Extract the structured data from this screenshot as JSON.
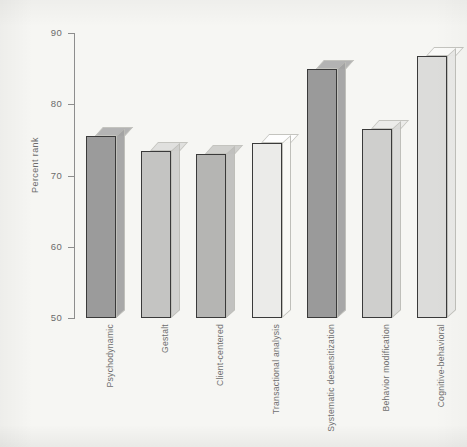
{
  "chart_data": {
    "type": "bar",
    "title": "",
    "xlabel": "",
    "ylabel": "Percent rank",
    "ylim": [
      50,
      90
    ],
    "yticks": [
      50,
      60,
      70,
      80,
      90
    ],
    "ytick_labels": [
      "50",
      "60",
      "70",
      "80",
      "90"
    ],
    "grid": false,
    "legend": null,
    "style": "3d-block-bars-grayscale",
    "categories": [
      "Psychodynamic",
      "Gestalt",
      "Client-centered",
      "Transactional analysis",
      "Systematic desensitization",
      "Behavior modification",
      "Cognitive-behavioral"
    ],
    "values": [
      75.5,
      73.5,
      73.0,
      74.5,
      85.0,
      76.5,
      86.8
    ],
    "bar_colors": [
      "#9b9b9b",
      "#c4c4c2",
      "#b5b5b3",
      "#ebebe9",
      "#9a9a9a",
      "#cfcfcd",
      "#dcdcda"
    ]
  },
  "axis": {
    "y_title": "Percent rank",
    "tick_50": "50",
    "tick_60": "60",
    "tick_70": "70",
    "tick_80": "80",
    "tick_90": "90"
  },
  "colors": {
    "background": "#f6f6f3",
    "axis": "#8d8d8d",
    "text": "#6b6b6b",
    "bar_outline": "#3a3a3a"
  }
}
